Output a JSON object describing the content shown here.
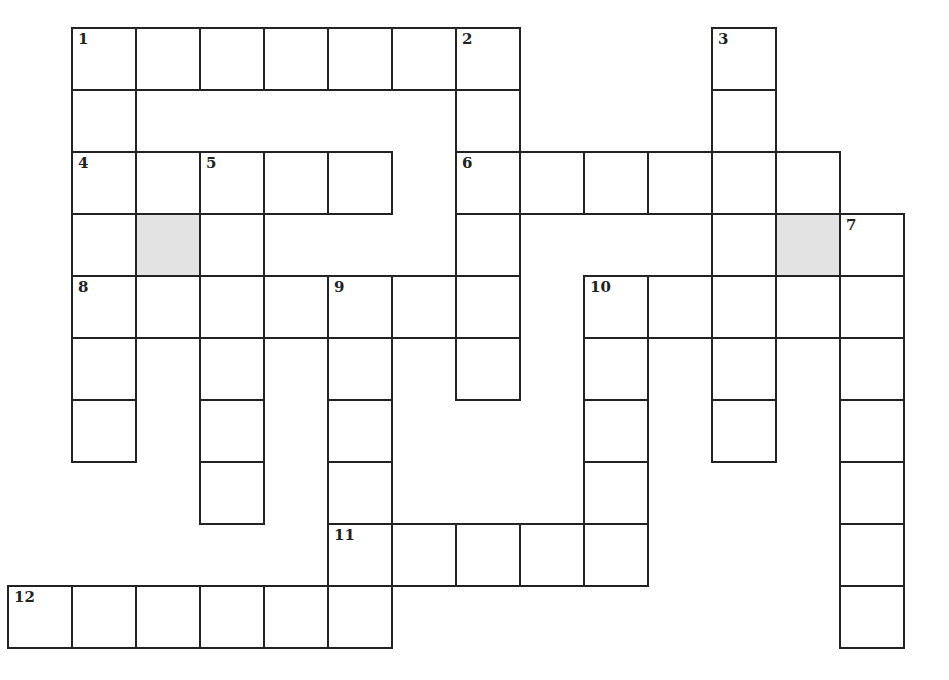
{
  "puzzle": {
    "type": "crossword",
    "cell_width": 64,
    "cell_height": 62,
    "origin_x": 8,
    "origin_y": 28,
    "colors": {
      "border": "#222222",
      "cell": "#ffffff",
      "shaded": "#e3e3e3"
    },
    "cells": [
      {
        "r": 0,
        "c": 1,
        "n": "1"
      },
      {
        "r": 0,
        "c": 2
      },
      {
        "r": 0,
        "c": 3
      },
      {
        "r": 0,
        "c": 4
      },
      {
        "r": 0,
        "c": 5
      },
      {
        "r": 0,
        "c": 6
      },
      {
        "r": 0,
        "c": 7,
        "n": "2"
      },
      {
        "r": 0,
        "c": 11,
        "n": "3"
      },
      {
        "r": 1,
        "c": 1
      },
      {
        "r": 1,
        "c": 7
      },
      {
        "r": 1,
        "c": 11
      },
      {
        "r": 2,
        "c": 1,
        "n": "4"
      },
      {
        "r": 2,
        "c": 2
      },
      {
        "r": 2,
        "c": 3,
        "n": "5"
      },
      {
        "r": 2,
        "c": 4
      },
      {
        "r": 2,
        "c": 5
      },
      {
        "r": 2,
        "c": 7,
        "n": "6"
      },
      {
        "r": 2,
        "c": 8
      },
      {
        "r": 2,
        "c": 9
      },
      {
        "r": 2,
        "c": 10
      },
      {
        "r": 2,
        "c": 11
      },
      {
        "r": 2,
        "c": 12
      },
      {
        "r": 3,
        "c": 1
      },
      {
        "r": 3,
        "c": 2,
        "shaded": true
      },
      {
        "r": 3,
        "c": 3
      },
      {
        "r": 3,
        "c": 7
      },
      {
        "r": 3,
        "c": 11
      },
      {
        "r": 3,
        "c": 12,
        "shaded": true
      },
      {
        "r": 3,
        "c": 13,
        "n": "7"
      },
      {
        "r": 4,
        "c": 1,
        "n": "8"
      },
      {
        "r": 4,
        "c": 2
      },
      {
        "r": 4,
        "c": 3
      },
      {
        "r": 4,
        "c": 4
      },
      {
        "r": 4,
        "c": 5,
        "n": "9"
      },
      {
        "r": 4,
        "c": 6
      },
      {
        "r": 4,
        "c": 7
      },
      {
        "r": 4,
        "c": 9,
        "n": "10"
      },
      {
        "r": 4,
        "c": 10
      },
      {
        "r": 4,
        "c": 11
      },
      {
        "r": 4,
        "c": 12
      },
      {
        "r": 4,
        "c": 13
      },
      {
        "r": 5,
        "c": 1
      },
      {
        "r": 5,
        "c": 3
      },
      {
        "r": 5,
        "c": 5
      },
      {
        "r": 5,
        "c": 7
      },
      {
        "r": 5,
        "c": 9
      },
      {
        "r": 5,
        "c": 11
      },
      {
        "r": 5,
        "c": 13
      },
      {
        "r": 6,
        "c": 1
      },
      {
        "r": 6,
        "c": 3
      },
      {
        "r": 6,
        "c": 5
      },
      {
        "r": 6,
        "c": 9
      },
      {
        "r": 6,
        "c": 11
      },
      {
        "r": 6,
        "c": 13
      },
      {
        "r": 7,
        "c": 3
      },
      {
        "r": 7,
        "c": 5
      },
      {
        "r": 7,
        "c": 9
      },
      {
        "r": 7,
        "c": 13
      },
      {
        "r": 8,
        "c": 5,
        "n": "11"
      },
      {
        "r": 8,
        "c": 6
      },
      {
        "r": 8,
        "c": 7
      },
      {
        "r": 8,
        "c": 8
      },
      {
        "r": 8,
        "c": 9
      },
      {
        "r": 8,
        "c": 13
      },
      {
        "r": 9,
        "c": 0,
        "n": "12"
      },
      {
        "r": 9,
        "c": 1
      },
      {
        "r": 9,
        "c": 2
      },
      {
        "r": 9,
        "c": 3
      },
      {
        "r": 9,
        "c": 4
      },
      {
        "r": 9,
        "c": 5
      },
      {
        "r": 9,
        "c": 13
      }
    ],
    "clue_numbers": [
      "1",
      "2",
      "3",
      "4",
      "5",
      "6",
      "7",
      "8",
      "9",
      "10",
      "11",
      "12"
    ]
  }
}
